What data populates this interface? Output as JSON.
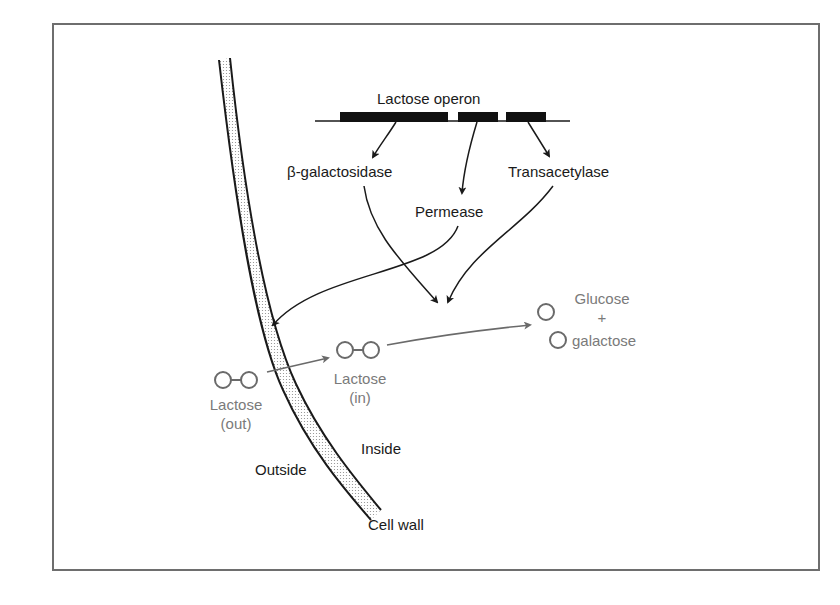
{
  "diagram": {
    "title": "Lactose operon",
    "genes": [
      {
        "name": "beta-galactosidase",
        "label": "β-galactosidase"
      },
      {
        "name": "permease",
        "label": "Permease"
      },
      {
        "name": "transacetylase",
        "label": "Transacetylase"
      }
    ],
    "molecules": {
      "lactose_out": {
        "line1": "Lactose",
        "line2": "(out)"
      },
      "lactose_in": {
        "line1": "Lactose",
        "line2": "(in)"
      },
      "products": {
        "glucose": "Glucose",
        "plus": "+",
        "galactose": "galactose"
      }
    },
    "regions": {
      "outside": "Outside",
      "inside": "Inside",
      "cell_wall": "Cell wall"
    },
    "colors": {
      "ink": "#1a1a1a",
      "molecule_gray": "#7a7a7a",
      "frame": "#6e6e6e",
      "wall_fill": "#d9d9d9"
    }
  }
}
